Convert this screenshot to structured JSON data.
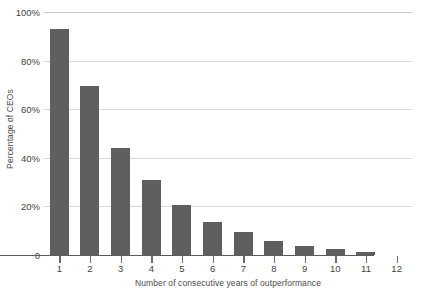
{
  "chart_data": {
    "type": "bar",
    "title": "",
    "xlabel": "Number of consecutive years of outperformance",
    "ylabel": "Percentage of CEOs",
    "categories": [
      "1",
      "2",
      "3",
      "4",
      "5",
      "6",
      "7",
      "8",
      "9",
      "10",
      "11",
      "12"
    ],
    "values": [
      93,
      69.5,
      44,
      31,
      20.5,
      13.5,
      9.5,
      5.8,
      3.8,
      2.4,
      1.2,
      0
    ],
    "ylim": [
      0,
      100
    ],
    "ytick_labels": [
      "100%",
      "80%",
      "60%",
      "40%",
      "20%",
      "0"
    ],
    "ytick_values": [
      100,
      80,
      60,
      40,
      20,
      0
    ],
    "grid": true,
    "legend": "none",
    "series": [
      {
        "name": "Percentage of CEOs",
        "values": [
          93,
          69.5,
          44,
          31,
          20.5,
          13.5,
          9.5,
          5.8,
          3.8,
          2.4,
          1.2,
          0
        ]
      }
    ]
  },
  "style": {
    "bar_color": "#5f5f5f",
    "gridline_color": "#d9d9d9",
    "axis_color": "#5b5b5b",
    "background": "#ffffff",
    "text_color": "#3f3f3f"
  }
}
